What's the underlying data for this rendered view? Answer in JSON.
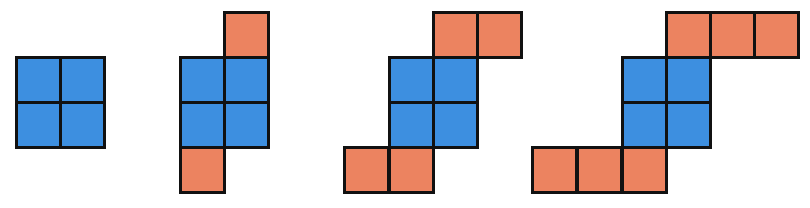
{
  "diagram": {
    "cell_size_px": 44.5,
    "colors": {
      "core": "#3d8fe0",
      "arm": "#ec8360",
      "border": "#111111",
      "background": "#ffffff"
    },
    "figures": [
      {
        "index": 1,
        "blue_count": 4,
        "orange_count": 0,
        "cells": [
          {
            "x": 15,
            "y": 56,
            "color": "blue"
          },
          {
            "x": 59,
            "y": 56,
            "color": "blue"
          },
          {
            "x": 15,
            "y": 101,
            "color": "blue"
          },
          {
            "x": 59,
            "y": 101,
            "color": "blue"
          }
        ]
      },
      {
        "index": 2,
        "blue_count": 4,
        "orange_count": 2,
        "cells": [
          {
            "x": 223,
            "y": 11,
            "color": "orange"
          },
          {
            "x": 179,
            "y": 56,
            "color": "blue"
          },
          {
            "x": 223,
            "y": 56,
            "color": "blue"
          },
          {
            "x": 179,
            "y": 101,
            "color": "blue"
          },
          {
            "x": 223,
            "y": 101,
            "color": "blue"
          },
          {
            "x": 179,
            "y": 146,
            "color": "orange"
          }
        ]
      },
      {
        "index": 3,
        "blue_count": 4,
        "orange_count": 4,
        "cells": [
          {
            "x": 432,
            "y": 11,
            "color": "orange"
          },
          {
            "x": 476,
            "y": 11,
            "color": "orange"
          },
          {
            "x": 388,
            "y": 56,
            "color": "blue"
          },
          {
            "x": 432,
            "y": 56,
            "color": "blue"
          },
          {
            "x": 388,
            "y": 101,
            "color": "blue"
          },
          {
            "x": 432,
            "y": 101,
            "color": "blue"
          },
          {
            "x": 343,
            "y": 146,
            "color": "orange"
          },
          {
            "x": 388,
            "y": 146,
            "color": "orange"
          }
        ]
      },
      {
        "index": 4,
        "blue_count": 4,
        "orange_count": 6,
        "cells": [
          {
            "x": 665,
            "y": 11,
            "color": "orange"
          },
          {
            "x": 709,
            "y": 11,
            "color": "orange"
          },
          {
            "x": 753,
            "y": 11,
            "color": "orange"
          },
          {
            "x": 621,
            "y": 56,
            "color": "blue"
          },
          {
            "x": 665,
            "y": 56,
            "color": "blue"
          },
          {
            "x": 621,
            "y": 101,
            "color": "blue"
          },
          {
            "x": 665,
            "y": 101,
            "color": "blue"
          },
          {
            "x": 531,
            "y": 146,
            "color": "orange"
          },
          {
            "x": 576,
            "y": 146,
            "color": "orange"
          },
          {
            "x": 621,
            "y": 146,
            "color": "orange"
          }
        ]
      }
    ]
  }
}
